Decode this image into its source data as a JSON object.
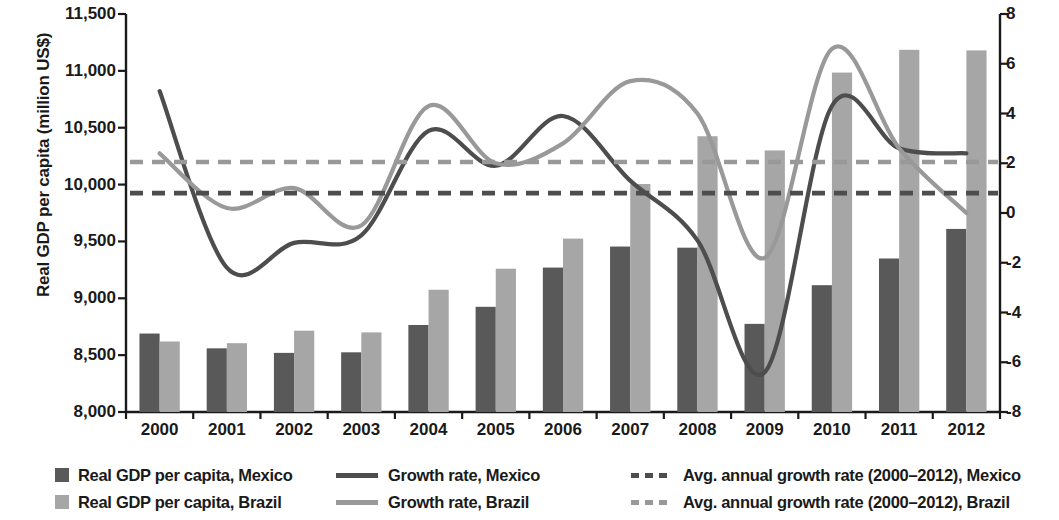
{
  "chart_data": {
    "type": "bar",
    "title": "",
    "categories": [
      "2000",
      "2001",
      "2002",
      "2003",
      "2004",
      "2005",
      "2006",
      "2007",
      "2008",
      "2009",
      "2010",
      "2011",
      "2012"
    ],
    "axes": {
      "left": {
        "label": "Real GDP per capita (million US$)",
        "ticks": [
          "8,000",
          "8,500",
          "9,000",
          "9,500",
          "10,000",
          "10,500",
          "11,000",
          "11,500"
        ],
        "tick_values": [
          8000,
          8500,
          9000,
          9500,
          10000,
          10500,
          11000,
          11500
        ],
        "min": 8000,
        "max": 11500
      },
      "right": {
        "label": "Growth rate (%)",
        "ticks": [
          "-8",
          "-6",
          "-4",
          "-2",
          "0",
          "2",
          "4",
          "6",
          "8"
        ],
        "tick_values": [
          -8,
          -6,
          -4,
          -2,
          0,
          2,
          4,
          6,
          8
        ],
        "min": -8,
        "max": 8
      },
      "xlabel": "",
      "grid": false
    },
    "legend_position": "below",
    "series": [
      {
        "name": "Real GDP per capita, Mexico",
        "kind": "bar",
        "axis": "left",
        "color": "#595959",
        "values": [
          8690,
          8560,
          8520,
          8525,
          8765,
          8925,
          9270,
          9455,
          9445,
          8775,
          9115,
          9350,
          9610
        ]
      },
      {
        "name": "Real GDP per capita, Brazil",
        "kind": "bar",
        "axis": "left",
        "color": "#a6a6a6",
        "values": [
          8620,
          8605,
          8715,
          8700,
          9075,
          9260,
          9525,
          10005,
          10425,
          10300,
          10985,
          11185,
          11180
        ]
      },
      {
        "name": "Growth rate, Mexico",
        "kind": "line",
        "axis": "right",
        "color": "#4d4d4d",
        "values": [
          4.9,
          -2.2,
          -1.2,
          -0.9,
          3.3,
          1.9,
          3.9,
          1.3,
          -1.1,
          -6.4,
          4.3,
          2.6,
          2.4
        ]
      },
      {
        "name": "Growth rate, Brazil",
        "kind": "line",
        "axis": "right",
        "color": "#999999",
        "values": [
          2.4,
          0.2,
          1.0,
          -0.5,
          4.3,
          2.0,
          2.8,
          5.3,
          4.0,
          -1.8,
          6.6,
          2.6,
          0.0
        ]
      },
      {
        "name": "Avg. annual growth rate (2000-2012), Mexico",
        "kind": "hline",
        "axis": "right",
        "color": "#4d4d4d",
        "value": 0.8
      },
      {
        "name": "Avg. annual growth rate (2000-2012), Brazil",
        "kind": "hline",
        "axis": "right",
        "color": "#999999",
        "value": 2.05
      }
    ]
  },
  "legend": {
    "col1": [
      {
        "label": "Real GDP per capita, Mexico",
        "marker": "square",
        "color": "#595959"
      },
      {
        "label": "Real GDP per capita, Brazil",
        "marker": "square",
        "color": "#a6a6a6"
      }
    ],
    "col2": [
      {
        "label": "Growth rate, Mexico",
        "marker": "solid-line",
        "color": "#4d4d4d"
      },
      {
        "label": "Growth rate, Brazil",
        "marker": "solid-line",
        "color": "#999999"
      }
    ],
    "col3": [
      {
        "label": "Avg. annual growth rate (2000–2012), Mexico",
        "marker": "dashed-line",
        "color": "#4d4d4d"
      },
      {
        "label": "Avg. annual growth rate (2000–2012), Brazil",
        "marker": "dashed-line",
        "color": "#999999"
      }
    ]
  }
}
